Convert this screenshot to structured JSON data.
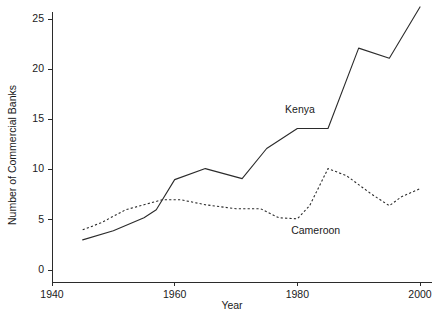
{
  "chart_data": {
    "type": "line",
    "title": "",
    "xlabel": "Year",
    "ylabel": "Number of Commercial Banks",
    "xlim": [
      1938,
      2002
    ],
    "ylim": [
      0,
      26.8
    ],
    "grid": false,
    "legend": "inline-labels",
    "xticks": [
      1940,
      1960,
      1980,
      2000
    ],
    "xticklabels": [
      "1940",
      "1960",
      "1980",
      "2000"
    ],
    "yticks": [
      0,
      5,
      10,
      15,
      20,
      25
    ],
    "yticklabels": [
      "0",
      "5",
      "10",
      "15",
      "20",
      "25"
    ],
    "series": [
      {
        "name": "Kenya",
        "style": "solid",
        "color": "#2b2b2b",
        "label_position": {
          "x": 1978,
          "y": 15.6
        },
        "points": [
          {
            "x": 1945,
            "y": 3.0
          },
          {
            "x": 1950,
            "y": 3.9
          },
          {
            "x": 1955,
            "y": 5.2
          },
          {
            "x": 1957,
            "y": 6.0
          },
          {
            "x": 1960,
            "y": 9.0
          },
          {
            "x": 1965,
            "y": 10.1
          },
          {
            "x": 1971,
            "y": 9.1
          },
          {
            "x": 1975,
            "y": 12.1
          },
          {
            "x": 1980,
            "y": 14.1
          },
          {
            "x": 1985,
            "y": 14.1
          },
          {
            "x": 1990,
            "y": 22.1
          },
          {
            "x": 1995,
            "y": 21.1
          },
          {
            "x": 2000,
            "y": 26.2
          }
        ]
      },
      {
        "name": "Cameroon",
        "style": "dashed",
        "color": "#2b2b2b",
        "label_position": {
          "x": 1979,
          "y": 3.55
        },
        "points": [
          {
            "x": 1945,
            "y": 4.0
          },
          {
            "x": 1948,
            "y": 4.7
          },
          {
            "x": 1952,
            "y": 6.0
          },
          {
            "x": 1955,
            "y": 6.5
          },
          {
            "x": 1958,
            "y": 7.0
          },
          {
            "x": 1961,
            "y": 7.0
          },
          {
            "x": 1965,
            "y": 6.5
          },
          {
            "x": 1970,
            "y": 6.1
          },
          {
            "x": 1974,
            "y": 6.1
          },
          {
            "x": 1977,
            "y": 5.2
          },
          {
            "x": 1980,
            "y": 5.1
          },
          {
            "x": 1982,
            "y": 6.4
          },
          {
            "x": 1985,
            "y": 10.1
          },
          {
            "x": 1988,
            "y": 9.4
          },
          {
            "x": 1992,
            "y": 7.6
          },
          {
            "x": 1995,
            "y": 6.4
          },
          {
            "x": 1997,
            "y": 7.3
          },
          {
            "x": 2000,
            "y": 8.1
          }
        ]
      }
    ]
  }
}
